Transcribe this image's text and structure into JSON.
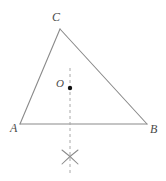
{
  "figure": {
    "name": "triangle-with-perpendicular-bisector-construction",
    "background_color": "#ffffff",
    "stroke_color": "#8a8a8a",
    "label_color": "#4a4a4a",
    "point_color": "#000000",
    "dash_color": "#a0a0a0"
  },
  "labels": {
    "vertex_c": "C",
    "vertex_a": "A",
    "vertex_b": "B",
    "point_o": "O"
  },
  "geometry": {
    "vertices": {
      "C": {
        "x": 60,
        "y": 29
      },
      "A": {
        "x": 20,
        "y": 124
      },
      "B": {
        "x": 147,
        "y": 124
      }
    },
    "interior_point_O": {
      "x": 70,
      "y": 88,
      "radius": 2.2
    },
    "dashed_line": {
      "x": 70,
      "y_top": 68,
      "y_bottom": 176
    },
    "arc_cross_mark": {
      "cx": 70,
      "cy": 157,
      "half_width": 8,
      "half_height": 7
    },
    "stroke_width": 1
  }
}
